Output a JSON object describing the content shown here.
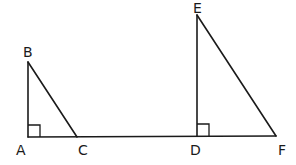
{
  "diagram": {
    "type": "geometry",
    "points": {
      "A": {
        "label": "A",
        "x": 28,
        "y": 137
      },
      "B": {
        "label": "B",
        "x": 28,
        "y": 62
      },
      "C": {
        "label": "C",
        "x": 77,
        "y": 137
      },
      "D": {
        "label": "D",
        "x": 197,
        "y": 137
      },
      "E": {
        "label": "E",
        "x": 197,
        "y": 15
      },
      "F": {
        "label": "F",
        "x": 276,
        "y": 137
      }
    },
    "triangles": [
      {
        "name": "ABC",
        "right_angle_at": "A"
      },
      {
        "name": "DEF",
        "right_angle_at": "D"
      }
    ],
    "segments": [
      "AB",
      "BC",
      "AF",
      "DE",
      "EF"
    ]
  },
  "labels": {
    "A": "A",
    "B": "B",
    "C": "C",
    "D": "D",
    "E": "E",
    "F": "F"
  },
  "colors": {
    "stroke": "#1a1a1a",
    "background": "#ffffff"
  }
}
